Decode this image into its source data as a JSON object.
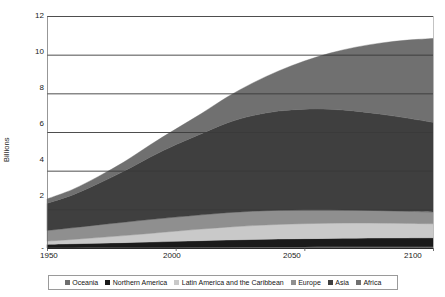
{
  "chart": {
    "type": "area",
    "ylabel": "Billions",
    "y_ticks": [
      "12",
      "10",
      "8",
      "6",
      "4",
      "2",
      "-"
    ],
    "x_ticks": [
      "1950",
      "2000",
      "2050",
      "2100"
    ]
  },
  "legend": {
    "items": [
      {
        "label": "Oceania",
        "color": "#6e6e6e"
      },
      {
        "label": "Northern America",
        "color": "#1a1a1a"
      },
      {
        "label": "Latin America and the Caribbean",
        "color": "#c9c9c9"
      },
      {
        "label": "Europe",
        "color": "#8f8f8f"
      },
      {
        "label": "Asia",
        "color": "#3f3f3f"
      },
      {
        "label": "Africa",
        "color": "#707070"
      }
    ]
  },
  "chart_data": {
    "type": "area",
    "title": "",
    "subtitle": "",
    "xlabel": "",
    "ylabel": "Billions",
    "xlim": [
      1950,
      2100
    ],
    "ylim": [
      0,
      12
    ],
    "y_ticks": [
      0,
      2,
      4,
      6,
      8,
      10,
      12
    ],
    "y_tick_labels": [
      "-",
      "2",
      "4",
      "6",
      "8",
      "10",
      "12"
    ],
    "x_ticks": [
      1950,
      2000,
      2050,
      2100
    ],
    "grid": "horizontal",
    "legend_position": "bottom",
    "stacked": true,
    "x": [
      1950,
      1960,
      1970,
      1980,
      1990,
      2000,
      2010,
      2020,
      2030,
      2040,
      2050,
      2060,
      2070,
      2080,
      2090,
      2100
    ],
    "series": [
      {
        "name": "Oceania",
        "color": "#6e6e6e",
        "values": [
          0.013,
          0.016,
          0.02,
          0.023,
          0.027,
          0.031,
          0.037,
          0.043,
          0.048,
          0.053,
          0.057,
          0.061,
          0.064,
          0.066,
          0.068,
          0.07
        ]
      },
      {
        "name": "Northern America",
        "color": "#1a1a1a",
        "values": [
          0.173,
          0.204,
          0.231,
          0.254,
          0.28,
          0.313,
          0.343,
          0.369,
          0.392,
          0.411,
          0.425,
          0.436,
          0.444,
          0.45,
          0.454,
          0.456
        ]
      },
      {
        "name": "Latin America and the Caribbean",
        "color": "#c9c9c9",
        "values": [
          0.169,
          0.221,
          0.288,
          0.364,
          0.446,
          0.526,
          0.6,
          0.667,
          0.718,
          0.754,
          0.776,
          0.785,
          0.782,
          0.77,
          0.75,
          0.726
        ]
      },
      {
        "name": "Europe",
        "color": "#8f8f8f",
        "values": [
          0.549,
          0.606,
          0.657,
          0.694,
          0.721,
          0.727,
          0.736,
          0.748,
          0.746,
          0.735,
          0.716,
          0.693,
          0.668,
          0.645,
          0.626,
          0.611
        ]
      },
      {
        "name": "Asia",
        "color": "#3f3f3f",
        "values": [
          1.405,
          1.7,
          2.142,
          2.642,
          3.221,
          3.741,
          4.194,
          4.641,
          4.947,
          5.128,
          5.207,
          5.2,
          5.121,
          4.986,
          4.82,
          4.635
        ]
      },
      {
        "name": "Africa",
        "color": "#707070",
        "values": [
          0.228,
          0.285,
          0.366,
          0.478,
          0.632,
          0.811,
          1.044,
          1.341,
          1.688,
          2.077,
          2.489,
          2.905,
          3.31,
          3.69,
          4.035,
          4.339
        ]
      }
    ],
    "totals": [
      2.54,
      3.03,
      3.7,
      4.46,
      5.33,
      6.15,
      6.96,
      7.81,
      8.54,
      9.16,
      9.67,
      10.08,
      10.39,
      10.61,
      10.75,
      10.84
    ],
    "annotations": []
  }
}
